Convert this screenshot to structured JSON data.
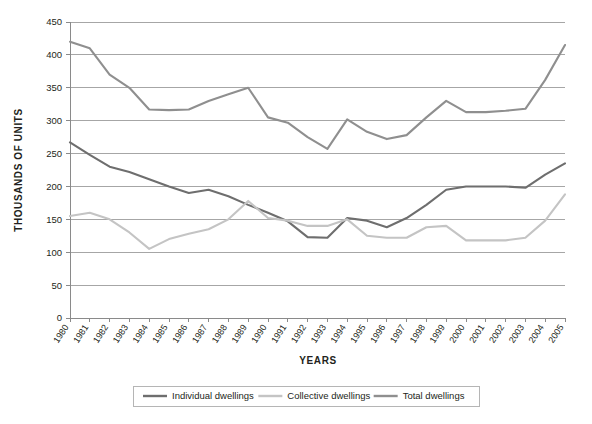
{
  "chart_data": {
    "type": "line",
    "title": "",
    "xlabel": "YEARS",
    "ylabel": "THOUSANDS OF UNITS",
    "ylim": [
      0,
      450
    ],
    "ytick_step": 50,
    "yticks": [
      "0",
      "50",
      "100",
      "150",
      "200",
      "250",
      "300",
      "350",
      "400",
      "450"
    ],
    "grid": true,
    "legend_position": "bottom",
    "categories": [
      "1980",
      "1981",
      "1982",
      "1983",
      "1984",
      "1985",
      "1986",
      "1987",
      "1988",
      "1989",
      "1990",
      "1991",
      "1992",
      "1993",
      "1994",
      "1995",
      "1996",
      "1997",
      "1998",
      "1999",
      "2000",
      "2001",
      "2002",
      "2003",
      "2004",
      "2005"
    ],
    "series": [
      {
        "name": "Individual dwellings",
        "color": "#6e6e6e",
        "values": [
          267,
          248,
          230,
          222,
          211,
          200,
          190,
          195,
          185,
          172,
          160,
          147,
          123,
          122,
          152,
          148,
          138,
          152,
          172,
          195,
          200,
          200,
          200,
          198,
          218,
          235
        ]
      },
      {
        "name": "Collective dwellings",
        "color": "#c4c4c4",
        "values": [
          155,
          160,
          150,
          130,
          105,
          120,
          128,
          135,
          150,
          178,
          152,
          148,
          140,
          140,
          150,
          125,
          122,
          122,
          138,
          140,
          118,
          118,
          118,
          122,
          148,
          188
        ]
      },
      {
        "name": "Total dwellings",
        "color": "#8f8f8f",
        "values": [
          420,
          410,
          370,
          350,
          317,
          316,
          317,
          330,
          340,
          350,
          305,
          297,
          275,
          257,
          302,
          283,
          272,
          278,
          305,
          330,
          313,
          313,
          315,
          318,
          362,
          415
        ]
      }
    ]
  },
  "layout": {
    "plot_left": 70,
    "plot_right": 565,
    "plot_top": 22,
    "plot_bottom": 318,
    "legend_left": 133,
    "legend_right": 479,
    "legend_top": 386,
    "legend_bottom": 406
  }
}
